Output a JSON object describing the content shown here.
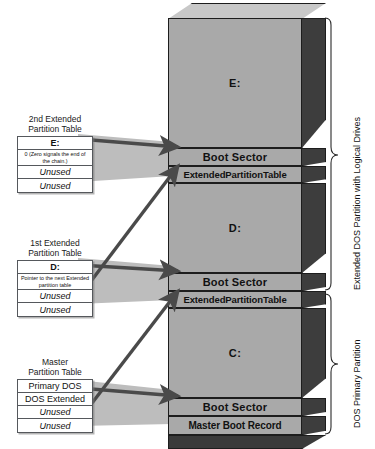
{
  "diagram": {
    "colors": {
      "front_face": "#a9a9a9",
      "side_face": "#3d3d3d",
      "top_face": "#c8c8c8",
      "outline": "#1d1d1d",
      "arrow": "#4a4a4a",
      "shadow_wedge": "#bdbdbd",
      "box_border": "#55585c",
      "box_fill": "#ffffff",
      "text": "#111111"
    }
  },
  "tables": [
    {
      "id": "second-extended",
      "caption": "2nd Extended\nPartition Table",
      "rows": [
        {
          "text": "E:",
          "style": "header"
        },
        {
          "text": "0 (Zero signals the\nend of the chain.)",
          "style": "note"
        },
        {
          "text": "Unused",
          "style": "unused"
        },
        {
          "text": "Unused",
          "style": "unused"
        }
      ]
    },
    {
      "id": "first-extended",
      "caption": "1st Extended\nPartition Table",
      "rows": [
        {
          "text": "D:",
          "style": "header"
        },
        {
          "text": "Pointer to the next\nExtended partition table",
          "style": "note"
        },
        {
          "text": "Unused",
          "style": "unused"
        },
        {
          "text": "Unused",
          "style": "unused"
        }
      ]
    },
    {
      "id": "master",
      "caption": "Master\nPartition Table",
      "rows": [
        {
          "text": "Primary DOS",
          "style": "plain"
        },
        {
          "text": "DOS Extended",
          "style": "plain"
        },
        {
          "text": "Unused",
          "style": "unused"
        },
        {
          "text": "Unused",
          "style": "unused"
        }
      ]
    }
  ],
  "disk": {
    "slabs": [
      {
        "id": "drive-e",
        "label": "E:",
        "kind": "volume"
      },
      {
        "id": "boot-sector-e",
        "label": "Boot Sector",
        "kind": "boot"
      },
      {
        "id": "ext-part-table-2",
        "label": "ExtendedPartitionTable",
        "kind": "ept"
      },
      {
        "id": "drive-d",
        "label": "D:",
        "kind": "volume"
      },
      {
        "id": "boot-sector-d",
        "label": "Boot Sector",
        "kind": "boot"
      },
      {
        "id": "ext-part-table-1",
        "label": "ExtendedPartitionTable",
        "kind": "ept"
      },
      {
        "id": "drive-c",
        "label": "C:",
        "kind": "volume"
      },
      {
        "id": "boot-sector-c",
        "label": "Boot Sector",
        "kind": "boot"
      },
      {
        "id": "master-boot-record",
        "label": "Master Boot Record",
        "kind": "mbr"
      }
    ]
  },
  "braces": [
    {
      "id": "extended-dos",
      "label": "Extended DOS Partition with Logical Drives"
    },
    {
      "id": "dos-primary",
      "label": "DOS Primary Partition"
    }
  ]
}
